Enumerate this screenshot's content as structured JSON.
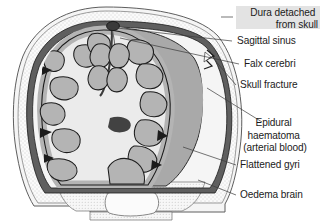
{
  "figure": {
    "background_color": "#ffffff"
  },
  "palette": {
    "scalp_fill": "#f4f4f4",
    "skull_fill": "#fafafa",
    "skull_stipple": "#9a9a9a",
    "dura_fill": "#5f5f5f",
    "dura_outline": "#232323",
    "haematoma_fill": "#a9a9a9",
    "haematoma_outline": "#2a2a2a",
    "cortex_fill": "#b4b4b4",
    "white_matter_fill": "#ebebeb",
    "ventricle_fill": "#1c1c1c",
    "sinus_fill": "#3a3a3a",
    "foramen_fill": "#fbfbfb",
    "label_text": "#1b1b1b",
    "leader_line": "#3b3b3b",
    "highlight_box": "#e3e3e3"
  },
  "labels": [
    {
      "id": "dura-detached",
      "lines": [
        "Dura detached",
        "from skull"
      ],
      "align": "end",
      "text_x": 318,
      "text_y": 16,
      "line_height": 12.4,
      "highlighted": true,
      "highlight": {
        "x": 236,
        "y": 6,
        "width": 84,
        "height": 23
      },
      "leader": "M 221,17 L 233,17"
    },
    {
      "id": "sagittal-sinus",
      "lines": [
        "Sagittal sinus"
      ],
      "align": "start",
      "text_x": 237,
      "text_y": 44,
      "line_height": 12.4,
      "highlighted": false,
      "leader": "M 117,28 L 232,41"
    },
    {
      "id": "falx-cerebri",
      "lines": [
        "Falx cerebri"
      ],
      "align": "start",
      "text_x": 244,
      "text_y": 67,
      "line_height": 12.4,
      "highlighted": false,
      "leader": "M 120,38 L 239,64"
    },
    {
      "id": "skull-fracture",
      "lines": [
        "Skull fracture"
      ],
      "align": "start",
      "text_x": 240,
      "text_y": 88,
      "line_height": 12.4,
      "highlighted": false,
      "leader": "M 213,58 L 236,85"
    },
    {
      "id": "epidural-haematoma",
      "lines": [
        "Epidural",
        "haematoma",
        "(arterial blood)"
      ],
      "align": "middle",
      "text_x": 275,
      "text_y": 126,
      "line_height": 12.6,
      "highlighted": false,
      "leader": "M 207,88 L 262,122"
    },
    {
      "id": "flattened-gyri",
      "lines": [
        "Flattened gyri"
      ],
      "align": "start",
      "text_x": 240,
      "text_y": 168,
      "line_height": 12.4,
      "highlighted": false,
      "leader": "M 183,147 L 236,165"
    },
    {
      "id": "oedema-brain",
      "lines": [
        "Oedema brain"
      ],
      "align": "start",
      "text_x": 240,
      "text_y": 198,
      "line_height": 12.4,
      "highlighted": false,
      "leader": "M 198,180 L 236,195"
    }
  ],
  "anatomy": {
    "scalp": {
      "name": "scalp-outer-contour"
    },
    "skull": {
      "name": "skull-bone-layer"
    },
    "dura": {
      "name": "dura-mater-layer"
    },
    "haematoma": {
      "name": "epidural-haematoma-mass"
    },
    "brain": {
      "name": "brain-cortex-and-gyri"
    },
    "sinus": {
      "name": "superior-sagittal-sinus"
    },
    "falx": {
      "name": "falx-cerebri-membrane"
    },
    "fracture": {
      "name": "skull-fracture-notch"
    },
    "foramen": {
      "name": "foramen-magnum-opening"
    }
  }
}
